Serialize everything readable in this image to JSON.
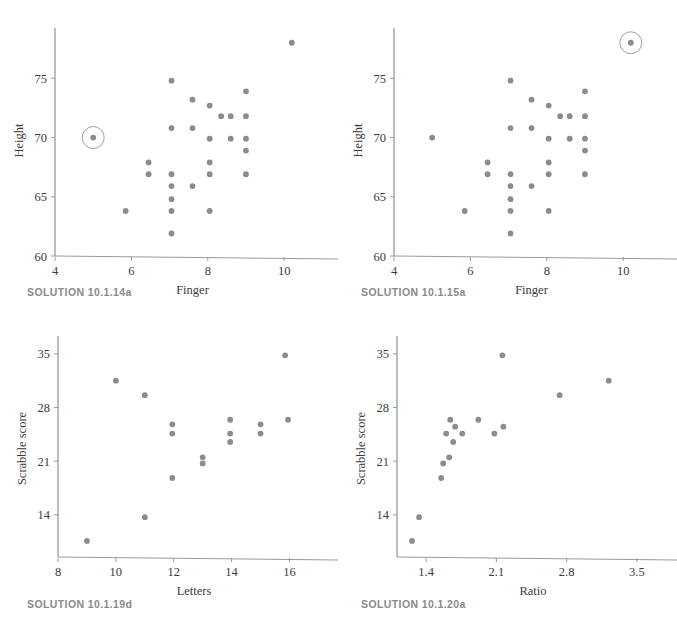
{
  "figure": {
    "background": "#ffffff",
    "marker_color": "#8c8c8c",
    "axis_color": "#9a9a9a",
    "text_color": "#3b3b3b",
    "caption_color": "#8a8a8a"
  },
  "panels": [
    {
      "id": "tl",
      "caption": "SOLUTION 10.1.14a",
      "chart_data": {
        "type": "scatter",
        "title": "",
        "xlabel": "Finger",
        "ylabel": "Height",
        "xlim": [
          4,
          11.2
        ],
        "ylim": [
          60,
          79.5
        ],
        "xticks": [
          4,
          6,
          8,
          10
        ],
        "xticklabels": [
          "4",
          "6",
          "8",
          "10"
        ],
        "yticks": [
          60,
          65,
          70,
          75
        ],
        "yticklabels": [
          "60",
          "65",
          "70",
          "75"
        ],
        "grid": false,
        "legend": null,
        "points": [
          {
            "x": 5.0,
            "y": 70.0
          },
          {
            "x": 5.85,
            "y": 63.8
          },
          {
            "x": 6.45,
            "y": 67.9
          },
          {
            "x": 6.45,
            "y": 66.9
          },
          {
            "x": 7.05,
            "y": 74.8
          },
          {
            "x": 7.05,
            "y": 70.8
          },
          {
            "x": 7.05,
            "y": 66.9
          },
          {
            "x": 7.05,
            "y": 65.9
          },
          {
            "x": 7.05,
            "y": 64.8
          },
          {
            "x": 7.05,
            "y": 63.8
          },
          {
            "x": 7.05,
            "y": 61.9
          },
          {
            "x": 7.6,
            "y": 73.2
          },
          {
            "x": 7.6,
            "y": 70.8
          },
          {
            "x": 7.6,
            "y": 65.9
          },
          {
            "x": 8.05,
            "y": 72.7
          },
          {
            "x": 8.05,
            "y": 69.9
          },
          {
            "x": 8.05,
            "y": 67.9
          },
          {
            "x": 8.05,
            "y": 66.9
          },
          {
            "x": 8.05,
            "y": 63.8
          },
          {
            "x": 8.35,
            "y": 71.8
          },
          {
            "x": 8.6,
            "y": 71.8
          },
          {
            "x": 8.6,
            "y": 69.9
          },
          {
            "x": 9.0,
            "y": 73.9
          },
          {
            "x": 9.0,
            "y": 71.8
          },
          {
            "x": 9.0,
            "y": 69.9
          },
          {
            "x": 9.0,
            "y": 68.9
          },
          {
            "x": 9.0,
            "y": 66.9
          },
          {
            "x": 10.2,
            "y": 78.0
          }
        ],
        "highlight": {
          "x": 5.0,
          "y": 70.0,
          "shape": "circle-outline",
          "radius_px": 11
        }
      }
    },
    {
      "id": "tr",
      "caption": "SOLUTION 10.1.15a",
      "chart_data": {
        "type": "scatter",
        "title": "",
        "xlabel": "Finger",
        "ylabel": "Height",
        "xlim": [
          4,
          11.2
        ],
        "ylim": [
          60,
          79.5
        ],
        "xticks": [
          4,
          6,
          8,
          10
        ],
        "xticklabels": [
          "4",
          "6",
          "8",
          "10"
        ],
        "yticks": [
          60,
          65,
          70,
          75
        ],
        "yticklabels": [
          "60",
          "65",
          "70",
          "75"
        ],
        "grid": false,
        "legend": null,
        "points": [
          {
            "x": 5.0,
            "y": 70.0
          },
          {
            "x": 5.85,
            "y": 63.8
          },
          {
            "x": 6.45,
            "y": 67.9
          },
          {
            "x": 6.45,
            "y": 66.9
          },
          {
            "x": 7.05,
            "y": 74.8
          },
          {
            "x": 7.05,
            "y": 70.8
          },
          {
            "x": 7.05,
            "y": 66.9
          },
          {
            "x": 7.05,
            "y": 65.9
          },
          {
            "x": 7.05,
            "y": 64.8
          },
          {
            "x": 7.05,
            "y": 63.8
          },
          {
            "x": 7.05,
            "y": 61.9
          },
          {
            "x": 7.6,
            "y": 73.2
          },
          {
            "x": 7.6,
            "y": 70.8
          },
          {
            "x": 7.6,
            "y": 65.9
          },
          {
            "x": 8.05,
            "y": 72.7
          },
          {
            "x": 8.05,
            "y": 69.9
          },
          {
            "x": 8.05,
            "y": 67.9
          },
          {
            "x": 8.05,
            "y": 66.9
          },
          {
            "x": 8.05,
            "y": 63.8
          },
          {
            "x": 8.35,
            "y": 71.8
          },
          {
            "x": 8.6,
            "y": 71.8
          },
          {
            "x": 8.6,
            "y": 69.9
          },
          {
            "x": 9.0,
            "y": 73.9
          },
          {
            "x": 9.0,
            "y": 71.8
          },
          {
            "x": 9.0,
            "y": 69.9
          },
          {
            "x": 9.0,
            "y": 68.9
          },
          {
            "x": 9.0,
            "y": 66.9
          },
          {
            "x": 10.2,
            "y": 78.0
          }
        ],
        "highlight": {
          "x": 10.2,
          "y": 78.0,
          "shape": "circle-outline",
          "radius_px": 11
        }
      }
    },
    {
      "id": "bl",
      "caption": "SOLUTION 10.1.19d",
      "chart_data": {
        "type": "scatter",
        "title": "",
        "xlabel": "Letters",
        "ylabel": "Scrabble score",
        "xlim": [
          8,
          17.4
        ],
        "ylim": [
          8.5,
          36.8
        ],
        "xticks": [
          8,
          10,
          12,
          14,
          16
        ],
        "xticklabels": [
          "8",
          "10",
          "12",
          "14",
          "16"
        ],
        "yticks": [
          14,
          21,
          28,
          35
        ],
        "yticklabels": [
          "14",
          "21",
          "28",
          "35"
        ],
        "grid": false,
        "legend": null,
        "points": [
          {
            "x": 9.0,
            "y": 10.6
          },
          {
            "x": 10.0,
            "y": 31.5
          },
          {
            "x": 11.0,
            "y": 29.6
          },
          {
            "x": 11.0,
            "y": 13.7
          },
          {
            "x": 11.95,
            "y": 25.8
          },
          {
            "x": 11.95,
            "y": 24.6
          },
          {
            "x": 11.95,
            "y": 18.8
          },
          {
            "x": 13.0,
            "y": 21.5
          },
          {
            "x": 13.0,
            "y": 20.7
          },
          {
            "x": 13.95,
            "y": 26.4
          },
          {
            "x": 13.95,
            "y": 24.6
          },
          {
            "x": 13.95,
            "y": 23.5
          },
          {
            "x": 15.0,
            "y": 25.8
          },
          {
            "x": 15.0,
            "y": 24.6
          },
          {
            "x": 15.85,
            "y": 34.8
          },
          {
            "x": 15.95,
            "y": 26.4
          }
        ],
        "highlight": null
      }
    },
    {
      "id": "br",
      "caption": "SOLUTION 10.1.20a",
      "chart_data": {
        "type": "scatter",
        "title": "",
        "xlabel": "Ratio",
        "ylabel": "Scrabble score",
        "xlim": [
          1.11,
          3.82
        ],
        "ylim": [
          8.5,
          36.8
        ],
        "xticks": [
          1.4,
          2.1,
          2.8,
          3.5
        ],
        "xticklabels": [
          "1.4",
          "2.1",
          "2.8",
          "3.5"
        ],
        "yticks": [
          14,
          21,
          28,
          35
        ],
        "yticklabels": [
          "14",
          "21",
          "28",
          "35"
        ],
        "grid": false,
        "legend": null,
        "points": [
          {
            "x": 1.26,
            "y": 10.6
          },
          {
            "x": 1.33,
            "y": 13.7
          },
          {
            "x": 1.55,
            "y": 18.8
          },
          {
            "x": 1.57,
            "y": 20.7
          },
          {
            "x": 1.63,
            "y": 21.5
          },
          {
            "x": 1.6,
            "y": 24.6
          },
          {
            "x": 1.64,
            "y": 26.4
          },
          {
            "x": 1.69,
            "y": 25.5
          },
          {
            "x": 1.67,
            "y": 23.5
          },
          {
            "x": 1.76,
            "y": 24.6
          },
          {
            "x": 1.92,
            "y": 26.4
          },
          {
            "x": 2.08,
            "y": 24.6
          },
          {
            "x": 2.17,
            "y": 25.5
          },
          {
            "x": 2.16,
            "y": 34.8
          },
          {
            "x": 2.73,
            "y": 29.6
          },
          {
            "x": 3.22,
            "y": 31.5
          }
        ],
        "highlight": null
      }
    }
  ]
}
